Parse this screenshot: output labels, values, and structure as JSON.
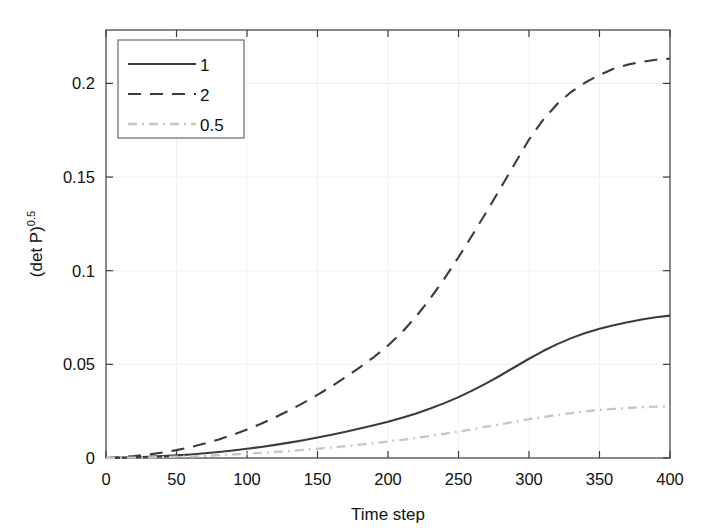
{
  "figure": {
    "background_color": "#ffffff",
    "plot_area": {
      "left_px": 106,
      "right_px": 670,
      "top_px": 30,
      "bottom_px": 458,
      "border_color": "#3b3b3b",
      "grid_color": "#f0f0f0",
      "grid_on": true
    }
  },
  "chart_data": {
    "type": "line",
    "title": "",
    "xlabel": "Time step",
    "ylabel": "(det P)",
    "ylabel_superscript": "0.5",
    "ylabel_full": "(det P)^0.5",
    "xlim": [
      0,
      400
    ],
    "ylim": [
      0,
      0.2285
    ],
    "xticks": [
      0,
      50,
      100,
      150,
      200,
      250,
      300,
      350,
      400
    ],
    "xticklabels": [
      "0",
      "50",
      "100",
      "150",
      "200",
      "250",
      "300",
      "350",
      "400"
    ],
    "yticks": [
      0,
      0.05,
      0.1,
      0.15,
      0.2
    ],
    "yticklabels": [
      "0",
      "0.05",
      "0.1",
      "0.15",
      "0.2"
    ],
    "grid": true,
    "legend_position": "upper-left",
    "x": [
      0,
      10,
      20,
      30,
      40,
      50,
      60,
      70,
      80,
      90,
      100,
      110,
      120,
      130,
      140,
      150,
      160,
      170,
      180,
      190,
      200,
      210,
      220,
      230,
      240,
      250,
      260,
      270,
      280,
      290,
      300,
      310,
      320,
      330,
      340,
      350,
      360,
      370,
      380,
      390,
      400
    ],
    "series": [
      {
        "name": "1",
        "label": "1",
        "color": "#3b3b3b",
        "linestyle": "solid",
        "linewidth": 2.1,
        "values": [
          0.0,
          0.0002,
          0.0004,
          0.0007,
          0.001,
          0.0014,
          0.0019,
          0.0025,
          0.0032,
          0.004,
          0.0049,
          0.0059,
          0.007,
          0.0082,
          0.0095,
          0.0109,
          0.0124,
          0.014,
          0.0157,
          0.0175,
          0.0194,
          0.0215,
          0.0238,
          0.0264,
          0.0293,
          0.0325,
          0.0361,
          0.04,
          0.0442,
          0.0486,
          0.053,
          0.0571,
          0.0608,
          0.064,
          0.0667,
          0.069,
          0.0709,
          0.0725,
          0.0739,
          0.0751,
          0.076
        ]
      },
      {
        "name": "2",
        "label": "2",
        "color": "#3b3b3b",
        "linestyle": "dashed",
        "linewidth": 2.1,
        "values": [
          0.0,
          0.0004,
          0.001,
          0.0018,
          0.0029,
          0.0042,
          0.0058,
          0.0077,
          0.0099,
          0.0124,
          0.0152,
          0.0183,
          0.0217,
          0.0254,
          0.0294,
          0.0337,
          0.0383,
          0.0432,
          0.0484,
          0.0539,
          0.06,
          0.0672,
          0.0756,
          0.0852,
          0.0958,
          0.1072,
          0.1192,
          0.1316,
          0.1443,
          0.1572,
          0.17,
          0.1805,
          0.189,
          0.1955,
          0.2005,
          0.2045,
          0.2078,
          0.21,
          0.2115,
          0.2126,
          0.2132
        ]
      },
      {
        "name": "0.5",
        "label": "0.5",
        "color": "#c6c6c6",
        "linestyle": "dashdot",
        "linewidth": 2.3,
        "values": [
          0.0,
          0.0001,
          0.0002,
          0.0003,
          0.0005,
          0.0007,
          0.0009,
          0.0012,
          0.0015,
          0.0019,
          0.0023,
          0.0027,
          0.0032,
          0.0037,
          0.0043,
          0.0049,
          0.0056,
          0.0063,
          0.0071,
          0.0079,
          0.0088,
          0.0097,
          0.0107,
          0.0118,
          0.0129,
          0.0141,
          0.0154,
          0.0167,
          0.018,
          0.0194,
          0.0207,
          0.0219,
          0.023,
          0.024,
          0.0249,
          0.0256,
          0.0262,
          0.0267,
          0.0271,
          0.0274,
          0.0276
        ]
      }
    ]
  }
}
